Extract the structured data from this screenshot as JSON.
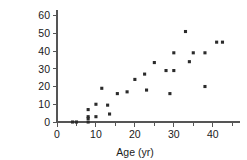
{
  "chart_data": {
    "type": "scatter",
    "title": "",
    "xlabel": "Age (yr)",
    "ylabel_line1": "Cross-Sectional",
    "ylabel_line2": "Area (sq in.)",
    "ylabel": "Cross-Sectional Area (sq in.)",
    "xlim": [
      0,
      47
    ],
    "ylim": [
      0,
      62
    ],
    "xticks": [
      0,
      10,
      20,
      30,
      40
    ],
    "xtick_labels": [
      "0",
      "10",
      "20",
      "30",
      "40"
    ],
    "yticks": [
      0,
      10,
      20,
      30,
      40,
      50,
      60
    ],
    "ytick_labels": [
      "0",
      "10",
      "20",
      "30",
      "40",
      "50",
      "60"
    ],
    "x_minor_ticks": [
      5,
      15,
      25,
      35,
      45
    ],
    "grid": false,
    "legend": null,
    "marker": "square",
    "marker_color": "#2b2b2b",
    "points": [
      {
        "x": 4,
        "y": 0
      },
      {
        "x": 5,
        "y": 0
      },
      {
        "x": 8,
        "y": 0
      },
      {
        "x": 8,
        "y": 2
      },
      {
        "x": 8,
        "y": 3
      },
      {
        "x": 8,
        "y": 7
      },
      {
        "x": 10,
        "y": 3
      },
      {
        "x": 10,
        "y": 10
      },
      {
        "x": 11.5,
        "y": 19
      },
      {
        "x": 13,
        "y": 9.5
      },
      {
        "x": 13.5,
        "y": 4.5
      },
      {
        "x": 15.5,
        "y": 16
      },
      {
        "x": 18,
        "y": 17
      },
      {
        "x": 20,
        "y": 24
      },
      {
        "x": 22.5,
        "y": 27
      },
      {
        "x": 23,
        "y": 18
      },
      {
        "x": 25,
        "y": 33.5
      },
      {
        "x": 28,
        "y": 29
      },
      {
        "x": 29,
        "y": 16
      },
      {
        "x": 30,
        "y": 29
      },
      {
        "x": 30,
        "y": 39
      },
      {
        "x": 33,
        "y": 51
      },
      {
        "x": 34,
        "y": 34
      },
      {
        "x": 35,
        "y": 39
      },
      {
        "x": 38,
        "y": 20
      },
      {
        "x": 38,
        "y": 39
      },
      {
        "x": 41,
        "y": 45
      },
      {
        "x": 42.5,
        "y": 45
      }
    ]
  }
}
